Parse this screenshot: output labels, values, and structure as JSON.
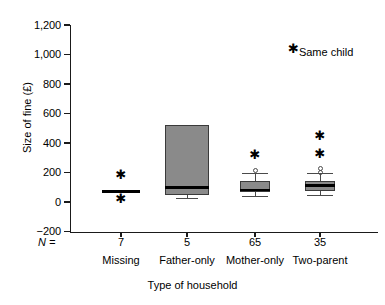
{
  "chart_data": {
    "type": "box",
    "title": "",
    "xlabel": "Type of household",
    "ylabel": "Size of fine (£)",
    "ylim": [
      -200,
      1200
    ],
    "ytick_labels": [
      "1,200",
      "1,000",
      "800",
      "600",
      "400",
      "200",
      "0",
      "−200"
    ],
    "ytick_values": [
      1200,
      1000,
      800,
      600,
      400,
      200,
      0,
      -200
    ],
    "grid": false,
    "legend": null,
    "n_label": "N =",
    "categories": [
      "Missing",
      "Father-only",
      "Mother-only",
      "Two-parent"
    ],
    "counts": [
      7,
      5,
      65,
      35
    ],
    "count_labels": [
      "7",
      "5",
      "65",
      "35"
    ],
    "annotation": {
      "marker": "✱",
      "text": "Same child"
    },
    "boxes": [
      {
        "category": "Missing",
        "n": 7,
        "collapsed": true,
        "q1": 70,
        "median": 70,
        "q3": 70,
        "whisker_low": 70,
        "whisker_high": 70,
        "outliers_extreme": [
          185,
          20
        ],
        "outliers_mild": []
      },
      {
        "category": "Father-only",
        "n": 5,
        "collapsed": false,
        "q1": 50,
        "median": 100,
        "q3": 520,
        "whisker_low": 30,
        "whisker_high": 520,
        "outliers_extreme": [],
        "outliers_mild": []
      },
      {
        "category": "Mother-only",
        "n": 65,
        "collapsed": false,
        "q1": 65,
        "median": 80,
        "q3": 145,
        "whisker_low": 40,
        "whisker_high": 200,
        "outliers_extreme": [
          320
        ],
        "outliers_mild": [
          215
        ]
      },
      {
        "category": "Two-parent",
        "n": 35,
        "collapsed": false,
        "q1": 75,
        "median": 110,
        "q3": 140,
        "whisker_low": 45,
        "whisker_high": 195,
        "outliers_extreme": [
          450,
          325
        ],
        "outliers_mild": [
          230,
          200
        ]
      }
    ],
    "colors": {
      "box_fill": "#8a8a8a",
      "box_edge": "#3a3a3a",
      "median": "#000000",
      "axis": "#1a1a1a",
      "background": "#ffffff"
    }
  }
}
